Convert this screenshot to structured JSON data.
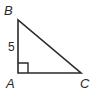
{
  "diagram": {
    "type": "right-triangle",
    "vertices": [
      {
        "label": "B",
        "x": 18,
        "y": 20
      },
      {
        "label": "A",
        "x": 18,
        "y": 73
      },
      {
        "label": "C",
        "x": 81,
        "y": 73
      }
    ],
    "labels": {
      "B": "B",
      "A": "A",
      "C": "C",
      "side_AB": "5"
    },
    "right_angle_at": "A",
    "stroke_color": "#2a2a2a"
  }
}
